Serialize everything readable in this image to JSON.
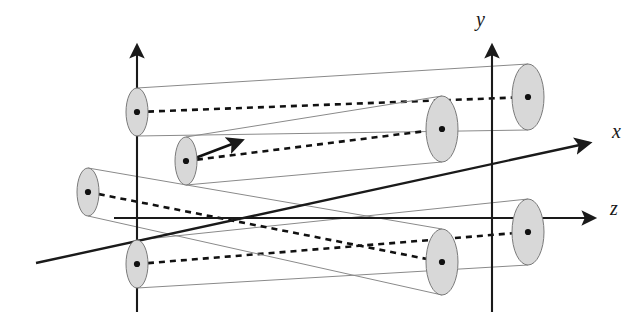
{
  "figure": {
    "background_color": "#ffffff",
    "width": 636,
    "height": 322
  },
  "colors": {
    "axis": "#1a1a1a",
    "beam_outline": "#8a8a8a",
    "beam_fill": "#ffffff",
    "cap_fill": "#d8d8d8",
    "cap_stroke": "#7a7a7a",
    "centerline": "#111111",
    "center_dot": "#111111"
  },
  "axes": {
    "y_axis": {
      "label": "y",
      "label_x": 476,
      "label_y": 26,
      "x": 492,
      "y_top": 44,
      "y_bottom": 312,
      "arrow": "up"
    },
    "z_axis": {
      "label": "z",
      "label_x": 612,
      "label_y": 213,
      "y": 218,
      "x_start": 114,
      "x_end": 598,
      "arrow": "right"
    },
    "x_axis": {
      "label": "x",
      "label_x": 614,
      "label_y": 136,
      "x1": 36,
      "y1": 263,
      "x2": 592,
      "y2": 142,
      "arrow": "upper-right"
    },
    "left_plane_axis": {
      "label": "",
      "x": 137,
      "y_top": 44,
      "y_bottom": 312,
      "arrow": "up"
    }
  },
  "beams": [
    {
      "name": "beam-upper-left-to-upper-right",
      "id": 1,
      "near_cap": {
        "cx": 137,
        "cy": 112,
        "rx": 11,
        "ry": 24
      },
      "far_cap": {
        "cx": 528,
        "cy": 97,
        "rx": 16,
        "ry": 33
      },
      "centerline_dashed": true,
      "arrow_on_centerline": false
    },
    {
      "name": "beam-mid-left-to-mid-right",
      "id": 2,
      "near_cap": {
        "cx": 186,
        "cy": 161,
        "rx": 11,
        "ry": 24
      },
      "far_cap": {
        "cx": 442,
        "cy": 129,
        "rx": 16,
        "ry": 33
      },
      "centerline_dashed": true,
      "arrow_on_centerline": true
    },
    {
      "name": "beam-left-origin-to-lower-right",
      "id": 3,
      "near_cap": {
        "cx": 88,
        "cy": 192,
        "rx": 11,
        "ry": 24
      },
      "far_cap": {
        "cx": 442,
        "cy": 262,
        "rx": 16,
        "ry": 33
      },
      "centerline_dashed": true,
      "arrow_on_centerline": false
    },
    {
      "name": "beam-lower-left-to-lower-right",
      "id": 4,
      "near_cap": {
        "cx": 137,
        "cy": 264,
        "rx": 11,
        "ry": 24
      },
      "far_cap": {
        "cx": 528,
        "cy": 232,
        "rx": 16,
        "ry": 33
      },
      "centerline_dashed": true,
      "arrow_on_centerline": false
    }
  ]
}
